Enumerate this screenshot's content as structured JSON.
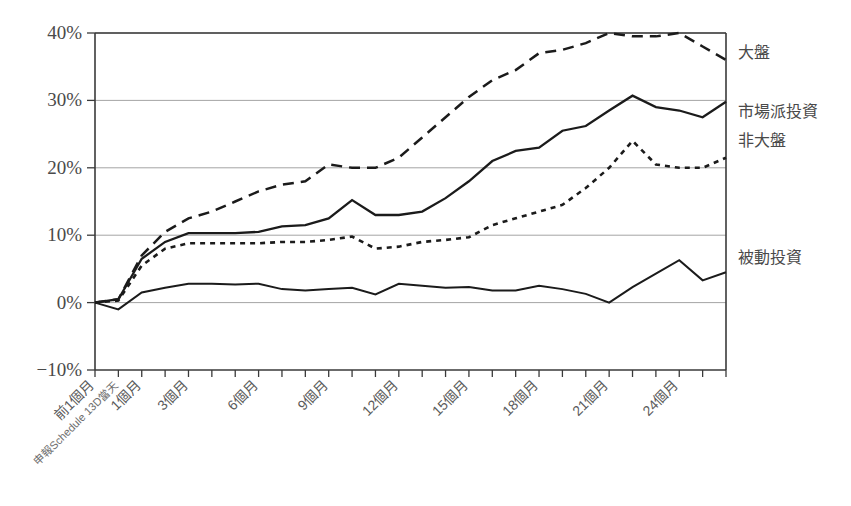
{
  "chart_data": {
    "type": "line",
    "title": "",
    "subtitle": "",
    "xlabel": "",
    "ylabel": "",
    "grid": true,
    "legend_position": "right",
    "ylim": [
      -10,
      40
    ],
    "ytick_labels": [
      "40%",
      "30%",
      "20%",
      "10%",
      "0%",
      "−10%"
    ],
    "ytick_values": [
      40,
      30,
      20,
      10,
      0,
      -10
    ],
    "xtick_labels": [
      "前1個月",
      "申報Schedule 13D當天",
      "1個月",
      "3個月",
      "6個月",
      "9個月",
      "12個月",
      "15個月",
      "18個月",
      "21個月",
      "24個月"
    ],
    "xtick_values": [
      -1,
      0,
      1,
      3,
      6,
      9,
      12,
      15,
      18,
      21,
      24
    ],
    "x": [
      -1,
      0,
      1,
      2,
      3,
      4,
      5,
      6,
      7,
      8,
      9,
      10,
      11,
      12,
      13,
      14,
      15,
      16,
      17,
      18,
      19,
      20,
      21,
      22,
      23,
      24,
      25,
      26
    ],
    "series": [
      {
        "name": "大盤",
        "style": "long-dash",
        "label_y_pct": 37.0,
        "values": [
          0.0,
          0.5,
          7.0,
          10.5,
          12.5,
          13.5,
          15.0,
          16.5,
          17.5,
          18.0,
          20.5,
          20.0,
          20.0,
          21.5,
          24.5,
          27.5,
          30.5,
          33.0,
          34.5,
          37.0,
          37.5,
          38.5,
          40.0,
          39.5,
          39.5,
          40.0,
          38.0,
          36.0
        ]
      },
      {
        "name": "市場派投資",
        "style": "solid",
        "label_y_pct": 28.0,
        "values": [
          0.0,
          0.5,
          6.5,
          9.0,
          10.3,
          10.3,
          10.3,
          10.5,
          11.3,
          11.5,
          12.5,
          15.2,
          13.0,
          13.0,
          13.5,
          15.5,
          18.0,
          21.0,
          22.5,
          23.0,
          25.5,
          26.2,
          28.5,
          30.7,
          29.0,
          28.5,
          27.5,
          29.8
        ]
      },
      {
        "name": "非大盤",
        "style": "dot-dash",
        "label_y_pct": 22.5,
        "values": [
          0.0,
          0.3,
          5.5,
          8.0,
          8.8,
          8.8,
          8.8,
          8.8,
          9.0,
          9.0,
          9.3,
          9.8,
          8.0,
          8.3,
          9.0,
          9.3,
          9.7,
          11.5,
          12.5,
          13.5,
          14.5,
          17.0,
          20.0,
          24.0,
          20.5,
          20.0,
          20.0,
          21.5
        ]
      },
      {
        "name": "被動投資",
        "style": "solid-thin",
        "label_y_pct": 6.0,
        "values": [
          0.0,
          -1.0,
          1.5,
          2.2,
          2.8,
          2.8,
          2.7,
          2.8,
          2.0,
          1.8,
          2.0,
          2.2,
          1.2,
          2.8,
          2.5,
          2.2,
          2.3,
          1.8,
          1.8,
          2.5,
          2.0,
          1.3,
          0.0,
          2.3,
          4.3,
          6.3,
          3.3,
          4.5
        ]
      }
    ],
    "legend": [
      {
        "label": "大盤",
        "y": 58
      },
      {
        "label": "市場派投資",
        "y": 117
      },
      {
        "label": "非大盤",
        "y": 146
      },
      {
        "label": "被動投資",
        "y": 263
      }
    ],
    "colors": {
      "ink": "#1b1b1b",
      "grid": "#9a9a9a",
      "axis": "#3a3a3a",
      "text": "#4a4a4a"
    }
  }
}
